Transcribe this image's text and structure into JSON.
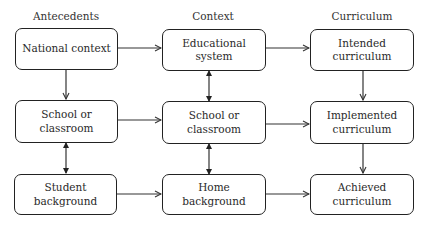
{
  "diagram": {
    "columns": [
      {
        "label": "Antecedents"
      },
      {
        "label": "Context"
      },
      {
        "label": "Curriculum"
      }
    ],
    "nodes": {
      "national_context": "National context",
      "school_classroom_antecedent": "School or classroom",
      "student_background": "Student background",
      "educational_system": "Educational system",
      "school_classroom_context": "School or classroom",
      "home_background": "Home background",
      "intended_curriculum": "Intended curriculum",
      "implemented_curriculum": "Implemented curriculum",
      "achieved_curriculum": "Achieved curriculum"
    },
    "edges": [
      {
        "from": "National context",
        "to": "Educational system",
        "type": "arrow"
      },
      {
        "from": "National context",
        "to": "School or classroom (Antecedents)",
        "type": "arrow"
      },
      {
        "from": "School or classroom (Antecedents)",
        "to": "School or classroom (Context)",
        "type": "arrow"
      },
      {
        "from": "School or classroom (Antecedents)",
        "to": "Student background",
        "type": "bidirectional"
      },
      {
        "from": "Student background",
        "to": "Home background",
        "type": "arrow"
      },
      {
        "from": "Educational system",
        "to": "Intended curriculum",
        "type": "arrow"
      },
      {
        "from": "Educational system",
        "to": "School or classroom (Context)",
        "type": "bidirectional"
      },
      {
        "from": "School or classroom (Context)",
        "to": "Implemented curriculum",
        "type": "arrow"
      },
      {
        "from": "School or classroom (Context)",
        "to": "Home background",
        "type": "bidirectional"
      },
      {
        "from": "Home background",
        "to": "Achieved curriculum",
        "type": "arrow"
      },
      {
        "from": "Intended curriculum",
        "to": "Implemented curriculum",
        "type": "arrow"
      },
      {
        "from": "Implemented curriculum",
        "to": "Achieved curriculum",
        "type": "arrow"
      }
    ],
    "colors": {
      "stroke": "#222222",
      "text": "#2a2a2a",
      "background": "#ffffff"
    }
  }
}
